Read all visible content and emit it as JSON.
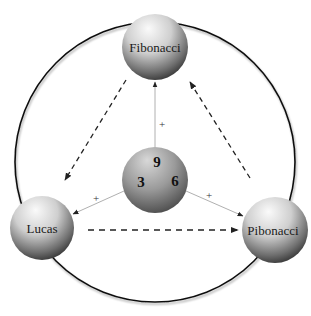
{
  "diagram": {
    "title": "",
    "nodes": {
      "top": {
        "label": "Fibonacci"
      },
      "left": {
        "label": "Lucas"
      },
      "right": {
        "label": "Pibonacci"
      },
      "center": {
        "numbers": [
          "9",
          "3",
          "6"
        ]
      }
    },
    "edges": {
      "center_to_top": {
        "label": "+"
      },
      "center_to_left": {
        "label": "+"
      },
      "center_to_right": {
        "label": "+"
      }
    },
    "cycle_arrows": [
      {
        "from": "Fibonacci",
        "to": "Lucas",
        "style": "dashed"
      },
      {
        "from": "Lucas",
        "to": "Pibonacci",
        "style": "dashed"
      },
      {
        "from": "Pibonacci",
        "to": "Fibonacci",
        "style": "dashed"
      }
    ],
    "colors": {
      "sphere_light": "#f2f2f2",
      "sphere_dark": "#2a2a2a",
      "ring": "#111111",
      "solid_edge": "#b0b0b0",
      "dashed_arrow": "#222222"
    }
  }
}
